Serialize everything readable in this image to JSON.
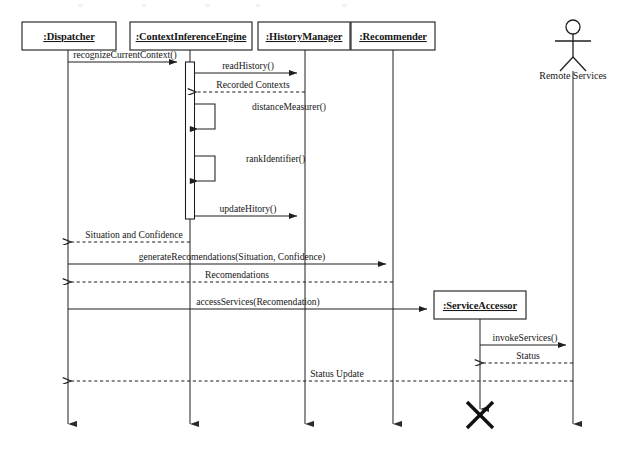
{
  "diagram": {
    "kind": "uml-sequence-diagram",
    "width": 624,
    "height": 450,
    "background_color": "#ffffff",
    "line_color": "#1f1f1f",
    "text_color": "#161616"
  },
  "participants": [
    {
      "id": "dispatcher",
      "label": ":Dispatcher",
      "type": "object",
      "x": 68,
      "box_x": 22,
      "box_y": 22,
      "box_w": 94,
      "box_h": 28
    },
    {
      "id": "cie",
      "label": ":ContextInferenceEngine",
      "type": "object",
      "x": 190,
      "box_x": 130,
      "box_y": 22,
      "box_w": 122,
      "box_h": 28
    },
    {
      "id": "historymgr",
      "label": ":HistoryManager",
      "type": "object",
      "x": 305,
      "box_x": 258,
      "box_y": 22,
      "box_w": 92,
      "box_h": 28
    },
    {
      "id": "recommender",
      "label": ":Recommender",
      "type": "object",
      "x": 393,
      "box_x": 351,
      "box_y": 22,
      "box_w": 84,
      "box_h": 28
    },
    {
      "id": "serviceaccessor",
      "label": ":ServiceAccessor",
      "type": "object",
      "x": 480,
      "box_x": 434,
      "box_y": 291,
      "box_w": 92,
      "box_h": 28
    },
    {
      "id": "remoteservices",
      "label": "Remote Services",
      "type": "actor",
      "x": 573,
      "box_x": 0,
      "box_y": 0,
      "box_w": 0,
      "box_h": 0
    }
  ],
  "messages": [
    {
      "id": "m1",
      "label": "recognizeCurrentContext()",
      "from": "dispatcher",
      "to": "cie",
      "y": 62,
      "style": "solid"
    },
    {
      "id": "m2",
      "label": "readHistory()",
      "from": "cie",
      "to": "historymgr",
      "y": 73,
      "style": "solid"
    },
    {
      "id": "m3",
      "label": "Recorded Contexts",
      "from": "historymgr",
      "to": "cie",
      "y": 92,
      "style": "dashed"
    },
    {
      "id": "m4",
      "label": "distanceMeasurer()",
      "from": "cie",
      "to": "cie",
      "y": 112,
      "style": "self"
    },
    {
      "id": "m5",
      "label": "rankIdentifier()",
      "from": "cie",
      "to": "cie",
      "y": 164,
      "style": "self"
    },
    {
      "id": "m6",
      "label": "updateHitory()",
      "from": "cie",
      "to": "historymgr",
      "y": 216,
      "style": "solid"
    },
    {
      "id": "m7",
      "label": "Situation and Confidence",
      "from": "cie",
      "to": "dispatcher",
      "y": 242,
      "style": "dashed"
    },
    {
      "id": "m8",
      "label": "generateRecomendations(Situation, Confidence)",
      "from": "dispatcher",
      "to": "recommender",
      "y": 264,
      "style": "solid"
    },
    {
      "id": "m9",
      "label": "Recomendations",
      "from": "recommender",
      "to": "dispatcher",
      "y": 282,
      "style": "dashed"
    },
    {
      "id": "m10",
      "label": "accessServices(Recomendation)",
      "from": "dispatcher",
      "to": "serviceaccessor",
      "y": 309,
      "style": "solid"
    },
    {
      "id": "m11",
      "label": "invokeServices()",
      "from": "serviceaccessor",
      "to": "remoteservices",
      "y": 345,
      "style": "solid"
    },
    {
      "id": "m12",
      "label": "Status",
      "from": "remoteservices",
      "to": "serviceaccessor",
      "y": 363,
      "style": "dashed"
    },
    {
      "id": "m13",
      "label": "Status Update",
      "from": "serviceaccessor",
      "to": "dispatcher",
      "y": 381,
      "style": "dashed"
    }
  ],
  "activations": [
    {
      "id": "act-cie",
      "participant": "cie",
      "x": 186,
      "y": 62,
      "w": 9,
      "h": 157
    }
  ],
  "self_calls": [
    {
      "id": "self-1",
      "participant": "cie",
      "label": "distanceMeasurer()",
      "top_y": 104,
      "bottom_y": 129,
      "right_x": 215,
      "label_x": 252
    },
    {
      "id": "self-2",
      "participant": "cie",
      "label": "rankIdentifier()",
      "top_y": 156,
      "bottom_y": 181,
      "right_x": 215,
      "label_x": 246
    }
  ],
  "destruction": {
    "id": "destroy-serviceaccessor",
    "participant": "serviceaccessor",
    "label": "destruction-marker",
    "x": 480,
    "y": 415,
    "size": 13
  },
  "actor": {
    "id": "remoteservices",
    "label": "Remote Services",
    "x": 573,
    "head_cy": 27,
    "head_r": 7,
    "body_top": 34,
    "body_bottom": 57,
    "arm_y": 41,
    "arm_half": 18,
    "leg_spread": 13,
    "leg_bottom": 71,
    "label_y": 79
  },
  "lifeline_bottom": 432
}
